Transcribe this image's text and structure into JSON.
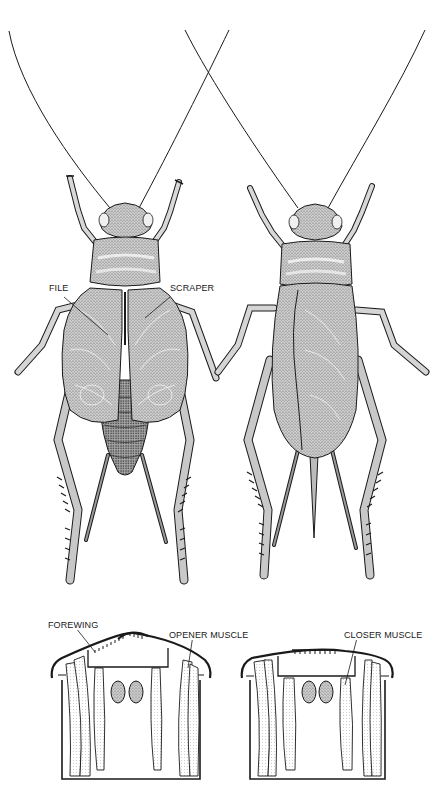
{
  "figure": {
    "panels": {
      "male_dorsal": {
        "description": "male cricket, dorsal view, wings closed"
      },
      "female_dorsal": {
        "description": "female cricket, dorsal view, with ovipositor"
      },
      "cross_section_open": {
        "description": "thorax cross-section, wing raised"
      },
      "cross_section_closed": {
        "description": "thorax cross-section, wing lowered"
      }
    },
    "labels": {
      "file": "FILE",
      "scraper": "SCRAPER",
      "forewing": "FOREWING",
      "opener_muscle": "OPENER MUSCLE",
      "closer_muscle": "CLOSER MUSCLE"
    },
    "colors": {
      "ink": "#1a1a1a",
      "stipple": "#6e6e6e",
      "wing_fill": "#bdbdbd",
      "body_fill": "#9a9a9a",
      "background": "#ffffff"
    }
  }
}
